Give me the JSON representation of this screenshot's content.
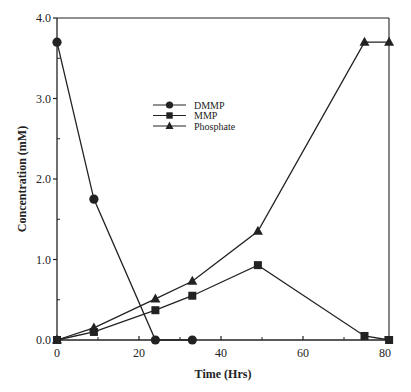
{
  "chart_data": {
    "type": "line",
    "title": "",
    "xlabel": "Time  (Hrs)",
    "ylabel": "Concentration  (mM)",
    "xlim": [
      0,
      81
    ],
    "ylim": [
      0,
      4.0
    ],
    "xticks": [
      0,
      20,
      40,
      60,
      80
    ],
    "xtick_labels": [
      "0",
      "20",
      "40",
      "60",
      "80"
    ],
    "xminor_ticks": [
      10,
      30,
      50,
      70
    ],
    "yticks": [
      0,
      1,
      2,
      3,
      4
    ],
    "ytick_labels": [
      "0.0",
      "1.0",
      "2.0",
      "3.0",
      "4.0"
    ],
    "yminor_ticks": [
      0.5,
      1.5,
      2.5,
      3.5
    ],
    "grid": false,
    "legend": {
      "placement": "upper-center"
    },
    "series": [
      {
        "name": "DMMP",
        "marker": "circle",
        "x": [
          0,
          9,
          24,
          33
        ],
        "y": [
          3.7,
          1.75,
          0.0,
          0.0
        ]
      },
      {
        "name": "MMP",
        "marker": "square",
        "x": [
          0,
          9,
          24,
          33,
          49,
          75,
          81
        ],
        "y": [
          0.0,
          0.1,
          0.37,
          0.55,
          0.93,
          0.05,
          0.0
        ]
      },
      {
        "name": "Phosphate",
        "marker": "triangle",
        "x": [
          0,
          9,
          24,
          33,
          49,
          75,
          81
        ],
        "y": [
          0.0,
          0.15,
          0.51,
          0.73,
          1.35,
          3.7,
          3.7
        ]
      }
    ],
    "line_color": "#222222"
  }
}
